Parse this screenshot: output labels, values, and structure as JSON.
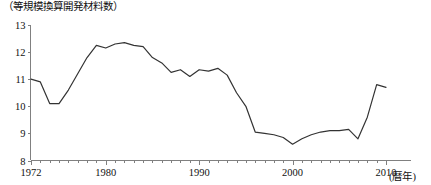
{
  "chart_data": {
    "type": "line",
    "title": "（等規模換算開発材料数）",
    "xlabel": "(暦年)",
    "ylabel": "",
    "xlim": [
      1972,
      2010
    ],
    "ylim": [
      8,
      13
    ],
    "ytick_labels": [
      "8",
      "9",
      "10",
      "11",
      "12",
      "13"
    ],
    "ytick_values": [
      8,
      9,
      10,
      11,
      12,
      13
    ],
    "xtick_labels": [
      "1972",
      "1980",
      "1990",
      "2000",
      "2010"
    ],
    "xtick_values": [
      1972,
      1980,
      1990,
      2000,
      2010
    ],
    "minor_xticks_interval": 1,
    "grid": false,
    "legend": null,
    "x": [
      1972,
      1973,
      1974,
      1975,
      1976,
      1977,
      1978,
      1979,
      1980,
      1981,
      1982,
      1983,
      1984,
      1985,
      1986,
      1987,
      1988,
      1989,
      1990,
      1991,
      1992,
      1993,
      1994,
      1995,
      1996,
      1997,
      1998,
      1999,
      2000,
      2001,
      2002,
      2003,
      2004,
      2005,
      2006,
      2007,
      2008,
      2009,
      2010
    ],
    "values": [
      11.0,
      10.9,
      10.1,
      10.1,
      10.6,
      11.2,
      11.8,
      12.25,
      12.15,
      12.3,
      12.35,
      12.25,
      12.2,
      11.8,
      11.6,
      11.25,
      11.35,
      11.1,
      11.35,
      11.3,
      11.4,
      11.15,
      10.5,
      10.0,
      9.05,
      9.0,
      8.95,
      8.85,
      8.6,
      8.8,
      8.95,
      9.05,
      9.1,
      9.1,
      9.15,
      8.8,
      9.6,
      10.8,
      10.7
    ],
    "series_name": "等規模換算開発材料数",
    "line_color": "#333333"
  }
}
